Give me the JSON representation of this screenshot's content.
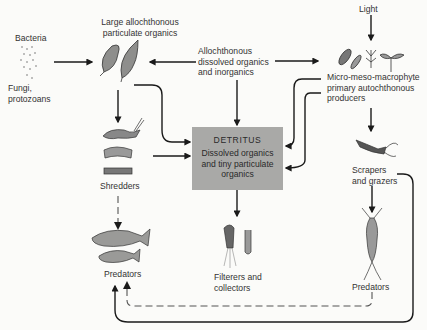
{
  "diagram": {
    "type": "food-web / energy-flow diagram",
    "nodes": {
      "bacteria": "Bacteria",
      "fungi": [
        "Fungi,",
        "protozoans"
      ],
      "large_organics": [
        "Large allochthonous",
        "particulate organics"
      ],
      "dissolved_allo": [
        "Allochthonous",
        "dissolved organics",
        "and inorganics"
      ],
      "light": "Light",
      "producers": [
        "Micro-meso-macrophyte",
        "primary autochthonous",
        "producers"
      ],
      "detritus_title": "DETRITUS",
      "detritus_desc": [
        "Dissolved organics",
        "and tiny particulate",
        "organics"
      ],
      "shredders": "Shredders",
      "scrapers": [
        "Scrapers",
        "and grazers"
      ],
      "filterers": [
        "Filterers and",
        "collectors"
      ],
      "predators_left": "Predators",
      "predators_right": "Predators"
    },
    "edges": [
      {
        "from": "bacteria/fungi",
        "to": "large_organics",
        "style": "solid"
      },
      {
        "from": "dissolved_allo",
        "to": "large_organics",
        "style": "solid"
      },
      {
        "from": "dissolved_allo",
        "to": "producers",
        "style": "solid"
      },
      {
        "from": "dissolved_allo",
        "to": "detritus",
        "style": "solid"
      },
      {
        "from": "light",
        "to": "producers",
        "style": "solid"
      },
      {
        "from": "large_organics",
        "to": "shredders",
        "style": "solid"
      },
      {
        "from": "large_organics",
        "to": "detritus",
        "style": "solid"
      },
      {
        "from": "shredders",
        "to": "detritus",
        "style": "solid"
      },
      {
        "from": "producers",
        "to": "detritus",
        "style": "solid (x2)"
      },
      {
        "from": "producers",
        "to": "scrapers",
        "style": "solid"
      },
      {
        "from": "detritus",
        "to": "filterers",
        "style": "solid"
      },
      {
        "from": "shredders",
        "to": "predators_left",
        "style": "dashed"
      },
      {
        "from": "scrapers",
        "to": "predators_right",
        "style": "solid"
      },
      {
        "from": "scrapers",
        "to": "predators_left",
        "style": "solid"
      },
      {
        "from": "predators_right",
        "to": "predators_left",
        "style": "dashed"
      }
    ],
    "colors": {
      "box_fill": "#a9a9a7",
      "line": "#1a1a1a",
      "text": "#333333",
      "background": "#fbfbf9"
    }
  }
}
